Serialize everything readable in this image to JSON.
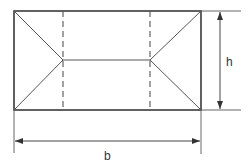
{
  "diagram": {
    "title": "",
    "labels": {
      "height": "h",
      "width": "b"
    },
    "colors": {
      "outline": "#3a3a3a",
      "inner": "#555555",
      "dashed": "#555555",
      "dimension": "#444444",
      "text": "#333333",
      "background": "#ffffff"
    },
    "geometry": {
      "rectangle": {
        "x1": 14,
        "y1": 11,
        "x2": 201,
        "y2": 110
      },
      "dashed_lines_x": [
        63,
        150
      ],
      "ridge": {
        "x1": 63,
        "x2": 150,
        "y": 60
      },
      "height_dimension": {
        "x": 220,
        "y1": 11,
        "y2": 110
      },
      "width_dimension": {
        "y": 141,
        "x1": 14,
        "x2": 201
      }
    }
  }
}
